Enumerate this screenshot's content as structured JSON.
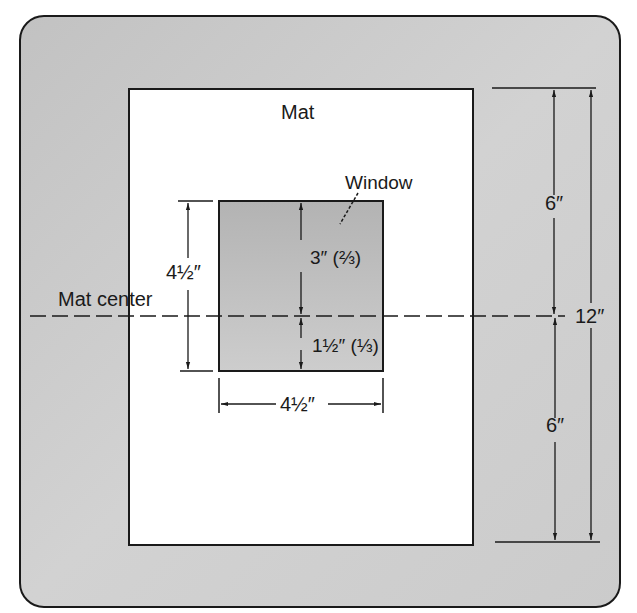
{
  "diagram": {
    "labels": {
      "mat": "Mat",
      "window": "Window",
      "mat_center": "Mat center",
      "window_height": "4½″",
      "window_width": "4½″",
      "upper_part": "3″ (⅔)",
      "lower_part": "1½″ (⅓)",
      "mat_upper_half": "6″",
      "mat_lower_half": "6″",
      "mat_total_height": "12″"
    },
    "colors": {
      "background_frame": "#c9c9c9",
      "mat": "#ffffff",
      "window": "#bdbdbd",
      "line": "#1a1a1a"
    }
  }
}
